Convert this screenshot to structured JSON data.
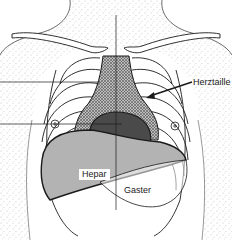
{
  "diagram": {
    "type": "anatomical-illustration",
    "labels": {
      "herztaille": "Herztaille",
      "hepar": "Hepar",
      "gaster": "Gaster"
    },
    "colors": {
      "line": "#1a1a1a",
      "heart_dark": "#4a4a4a",
      "mediastinum_hatch": "#8c8c8c",
      "liver_fill": "#b3b3b3",
      "skin_stipple": "#9a9a9a",
      "background": "#ffffff"
    }
  }
}
